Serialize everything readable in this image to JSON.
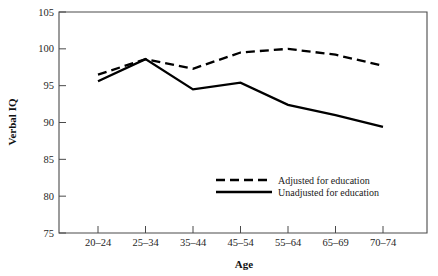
{
  "chart_data": {
    "type": "line",
    "title": "",
    "xlabel": "Age",
    "ylabel": "Verbal IQ",
    "categories": [
      "20–24",
      "25–34",
      "35–44",
      "45–54",
      "55–64",
      "65–69",
      "70–74"
    ],
    "ylim": [
      75,
      105
    ],
    "yticks": [
      75,
      80,
      85,
      90,
      95,
      100,
      105
    ],
    "ytick_labels": [
      "75",
      "80",
      "85",
      "90",
      "95",
      "100",
      "105"
    ],
    "grid": false,
    "legend_position": "center-right-inside",
    "series": [
      {
        "name": "Adjusted for education",
        "style": "dashed",
        "color": "#000000",
        "values": [
          96.5,
          98.6,
          97.3,
          99.5,
          100.0,
          99.2,
          97.7
        ]
      },
      {
        "name": "Unadjusted for education",
        "style": "solid",
        "color": "#000000",
        "values": [
          95.6,
          98.6,
          94.5,
          95.4,
          92.4,
          91.0,
          89.4
        ]
      }
    ]
  },
  "axes": {
    "y_title": "Verbal IQ",
    "x_title": "Age"
  },
  "legend": {
    "items": [
      {
        "label": "Adjusted for education",
        "style": "dashed"
      },
      {
        "label": "Unadjusted for education",
        "style": "solid"
      }
    ]
  }
}
